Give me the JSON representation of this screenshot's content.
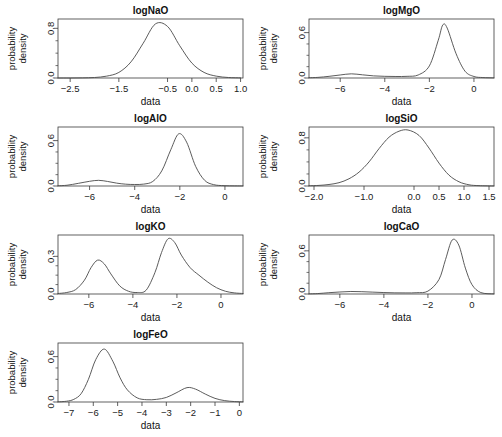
{
  "figure": {
    "width": 502,
    "height": 437,
    "background": "#ffffff",
    "curve_color": "#4a4a4a",
    "axis_color": "#3a3a3a",
    "panel_count": 7,
    "shared_xlabel": "data",
    "shared_ylabel_line1": "probability",
    "shared_ylabel_line2": "density"
  },
  "chart_data": [
    {
      "type": "line",
      "title": "logNaO",
      "xlabel": "data",
      "ylabel": "probability density",
      "xlim": [
        -2.75,
        1.05
      ],
      "ylim": [
        0.0,
        0.95
      ],
      "xticks": [
        -2.5,
        -1.5,
        -0.5,
        0.0,
        0.5,
        1.0
      ],
      "xticklabels": [
        "-2.5",
        "-1.5",
        "-0.5",
        "0.0",
        "0.5",
        "1.0"
      ],
      "yticks": [
        0.0,
        0.8
      ],
      "yticklabels": [
        "0.0",
        "0.8"
      ],
      "grid": false,
      "legend": "none",
      "components": [
        {
          "weight": 1.0,
          "mean": -0.75,
          "sd": 0.38,
          "peak": 0.87
        }
      ],
      "x": [
        -2.75,
        -2.5,
        -2.25,
        -2.0,
        -1.75,
        -1.5,
        -1.25,
        -1.0,
        -0.75,
        -0.5,
        -0.25,
        0.0,
        0.25,
        0.5,
        0.75,
        1.0
      ],
      "y": [
        0.0,
        0.0,
        0.002,
        0.008,
        0.03,
        0.09,
        0.26,
        0.56,
        0.87,
        0.83,
        0.52,
        0.24,
        0.09,
        0.03,
        0.008,
        0.002
      ]
    },
    {
      "type": "line",
      "title": "logMgO",
      "xlabel": "data",
      "ylabel": "probability density",
      "xlim": [
        -7.4,
        0.9
      ],
      "ylim": [
        0.0,
        0.78
      ],
      "xticks": [
        -6,
        -4,
        -2,
        0
      ],
      "xticklabels": [
        "-6",
        "-4",
        "-2",
        "0"
      ],
      "yticks": [
        0.0,
        0.6
      ],
      "yticklabels": [
        "0.0",
        "0.6"
      ],
      "grid": false,
      "legend": "none",
      "components": [
        {
          "weight": 0.14,
          "mean": -5.5,
          "sd": 0.5,
          "peak": 0.055
        },
        {
          "weight": 0.86,
          "mean": -1.4,
          "sd": 0.36,
          "peak": 0.7
        }
      ],
      "x": [
        -7.4,
        -7.0,
        -6.5,
        -6.0,
        -5.5,
        -5.0,
        -4.5,
        -4.0,
        -3.5,
        -3.0,
        -2.5,
        -2.0,
        -1.6,
        -1.4,
        -1.2,
        -0.8,
        -0.4,
        0.0,
        0.4,
        0.9
      ],
      "y": [
        0.004,
        0.008,
        0.022,
        0.04,
        0.055,
        0.042,
        0.028,
        0.022,
        0.02,
        0.022,
        0.04,
        0.16,
        0.5,
        0.7,
        0.66,
        0.32,
        0.09,
        0.02,
        0.006,
        0.002
      ]
    },
    {
      "type": "line",
      "title": "logAlO",
      "xlabel": "data",
      "ylabel": "probability density",
      "xlim": [
        -7.4,
        0.8
      ],
      "ylim": [
        0.0,
        0.78
      ],
      "xticks": [
        -6,
        -4,
        -2,
        0
      ],
      "xticklabels": [
        "-6",
        "-4",
        "-2",
        "0"
      ],
      "yticks": [
        0.0,
        0.6
      ],
      "yticklabels": [
        "0.0",
        "0.6"
      ],
      "grid": false,
      "legend": "none",
      "components": [
        {
          "weight": 0.16,
          "mean": -5.65,
          "sd": 0.55,
          "peak": 0.075
        },
        {
          "weight": 0.84,
          "mean": -2.05,
          "sd": 0.46,
          "peak": 0.69
        }
      ],
      "x": [
        -7.4,
        -7.0,
        -6.5,
        -6.0,
        -5.6,
        -5.2,
        -4.8,
        -4.4,
        -4.0,
        -3.6,
        -3.2,
        -2.8,
        -2.4,
        -2.05,
        -1.7,
        -1.3,
        -0.9,
        -0.5,
        0.0,
        0.8
      ],
      "y": [
        0.003,
        0.01,
        0.035,
        0.062,
        0.075,
        0.06,
        0.038,
        0.024,
        0.02,
        0.025,
        0.06,
        0.2,
        0.48,
        0.69,
        0.58,
        0.26,
        0.075,
        0.018,
        0.004,
        0.001
      ]
    },
    {
      "type": "line",
      "title": "logSiO",
      "xlabel": "data",
      "ylabel": "probability density",
      "xlim": [
        -2.1,
        1.6
      ],
      "ylim": [
        0.0,
        0.98
      ],
      "xticks": [
        -2.0,
        -1.0,
        0.0,
        0.5,
        1.0,
        1.5
      ],
      "xticklabels": [
        "-2.0",
        "-1.0",
        "0.0",
        "0.5",
        "1.0",
        "1.5"
      ],
      "yticks": [
        0.0,
        0.8
      ],
      "yticklabels": [
        "0.0",
        "0.8"
      ],
      "grid": false,
      "legend": "none",
      "components": [
        {
          "weight": 1.0,
          "mean": -0.12,
          "sd": 0.42,
          "peak": 0.93
        }
      ],
      "x": [
        -2.1,
        -1.9,
        -1.7,
        -1.5,
        -1.3,
        -1.1,
        -0.9,
        -0.7,
        -0.5,
        -0.3,
        -0.12,
        0.1,
        0.3,
        0.5,
        0.7,
        0.9,
        1.1,
        1.3,
        1.6
      ],
      "y": [
        0.004,
        0.01,
        0.025,
        0.055,
        0.12,
        0.23,
        0.4,
        0.62,
        0.81,
        0.91,
        0.93,
        0.84,
        0.63,
        0.38,
        0.18,
        0.07,
        0.02,
        0.006,
        0.001
      ]
    },
    {
      "type": "line",
      "title": "logKO",
      "xlabel": "data",
      "ylabel": "probability density",
      "xlim": [
        -7.4,
        1.0
      ],
      "ylim": [
        0.0,
        0.47
      ],
      "xticks": [
        -6,
        -4,
        -2,
        0
      ],
      "xticklabels": [
        "-6",
        "-4",
        "-2",
        "0"
      ],
      "yticks": [
        0.0,
        0.3
      ],
      "yticklabels": [
        "0.0",
        "0.3"
      ],
      "grid": false,
      "legend": "none",
      "components": [
        {
          "weight": 0.35,
          "mean": -5.6,
          "sd": 0.45,
          "peak": 0.27
        },
        {
          "weight": 0.65,
          "mean": -2.4,
          "sd": 0.55,
          "peak": 0.44
        }
      ],
      "x": [
        -7.4,
        -7.0,
        -6.6,
        -6.2,
        -5.9,
        -5.6,
        -5.3,
        -5.0,
        -4.6,
        -4.2,
        -3.8,
        -3.4,
        -3.0,
        -2.7,
        -2.4,
        -2.1,
        -1.8,
        -1.4,
        -1.0,
        -0.6,
        -0.2,
        0.2,
        0.6,
        1.0
      ],
      "y": [
        0.004,
        0.012,
        0.035,
        0.11,
        0.21,
        0.27,
        0.24,
        0.16,
        0.065,
        0.022,
        0.012,
        0.03,
        0.17,
        0.33,
        0.44,
        0.41,
        0.31,
        0.21,
        0.15,
        0.095,
        0.05,
        0.022,
        0.009,
        0.004
      ]
    },
    {
      "type": "line",
      "title": "logCaO",
      "xlabel": "data",
      "ylabel": "probability density",
      "xlim": [
        -7.4,
        1.0
      ],
      "ylim": [
        0.0,
        0.82
      ],
      "xticks": [
        -6,
        -4,
        -2,
        0
      ],
      "xticklabels": [
        "-6",
        "-4",
        "-2",
        "0"
      ],
      "yticks": [
        0.0,
        0.6
      ],
      "yticklabels": [
        "0.0",
        "0.6"
      ],
      "grid": false,
      "legend": "none",
      "components": [
        {
          "weight": 0.08,
          "mean": -5.5,
          "sd": 0.75,
          "peak": 0.035
        },
        {
          "weight": 0.92,
          "mean": -0.9,
          "sd": 0.33,
          "peak": 0.75
        }
      ],
      "x": [
        -7.4,
        -7.0,
        -6.5,
        -6.0,
        -5.5,
        -5.0,
        -4.5,
        -4.0,
        -3.5,
        -3.0,
        -2.5,
        -2.0,
        -1.5,
        -1.2,
        -0.9,
        -0.6,
        -0.3,
        0.0,
        0.4,
        1.0
      ],
      "y": [
        0.002,
        0.006,
        0.018,
        0.028,
        0.035,
        0.032,
        0.026,
        0.02,
        0.016,
        0.015,
        0.018,
        0.04,
        0.2,
        0.48,
        0.75,
        0.68,
        0.36,
        0.13,
        0.02,
        0.002
      ]
    },
    {
      "type": "line",
      "title": "logFeO",
      "xlabel": "data",
      "ylabel": "probability density",
      "xlim": [
        -7.45,
        0.15
      ],
      "ylim": [
        0.0,
        0.78
      ],
      "xticks": [
        -7,
        -6,
        -5,
        -4,
        -3,
        -2,
        -1,
        0
      ],
      "xticklabels": [
        "-7",
        "-6",
        "-5",
        "-4",
        "-3",
        "-2",
        "-1",
        "0"
      ],
      "yticks": [
        0.0,
        0.6
      ],
      "yticklabels": [
        "0.0",
        "0.6"
      ],
      "grid": false,
      "legend": "none",
      "components": [
        {
          "weight": 0.68,
          "mean": -5.55,
          "sd": 0.42,
          "peak": 0.7
        },
        {
          "weight": 0.32,
          "mean": -2.15,
          "sd": 0.55,
          "peak": 0.19
        }
      ],
      "x": [
        -7.45,
        -7.1,
        -6.8,
        -6.5,
        -6.2,
        -5.9,
        -5.55,
        -5.2,
        -4.9,
        -4.6,
        -4.2,
        -3.8,
        -3.4,
        -3.0,
        -2.6,
        -2.15,
        -1.8,
        -1.4,
        -1.0,
        -0.6,
        -0.2,
        0.15
      ],
      "y": [
        0.002,
        0.01,
        0.035,
        0.11,
        0.3,
        0.56,
        0.7,
        0.54,
        0.32,
        0.16,
        0.055,
        0.03,
        0.035,
        0.06,
        0.12,
        0.19,
        0.17,
        0.105,
        0.048,
        0.018,
        0.006,
        0.002
      ]
    }
  ],
  "panels": [
    {
      "title": "logNaO",
      "row": 0,
      "col": 0
    },
    {
      "title": "logMgO",
      "row": 0,
      "col": 1
    },
    {
      "title": "logAlO",
      "row": 1,
      "col": 0
    },
    {
      "title": "logSiO",
      "row": 1,
      "col": 1
    },
    {
      "title": "logKO",
      "row": 2,
      "col": 0
    },
    {
      "title": "logCaO",
      "row": 2,
      "col": 1
    },
    {
      "title": "logFeO",
      "row": 3,
      "col": 0
    }
  ]
}
